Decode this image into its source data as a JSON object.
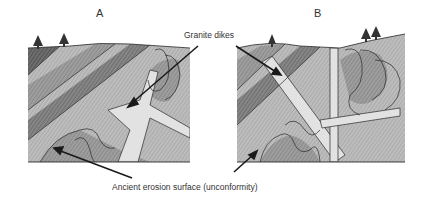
{
  "diagram": {
    "panels": [
      {
        "id": "A",
        "label": "A"
      },
      {
        "id": "B",
        "label": "B"
      }
    ],
    "labels": {
      "granite_dikes": "Granite dikes",
      "erosion_surface": "Ancient erosion surface (unconformity)"
    },
    "colors": {
      "background": "#ffffff",
      "dark_layer": "#4a4a4a",
      "mid_layer": "#8c8c8c",
      "light_layer": "#c9c9c9",
      "dike": "#dcdcdc",
      "outline": "#2a2a2a",
      "text": "#333333"
    }
  }
}
